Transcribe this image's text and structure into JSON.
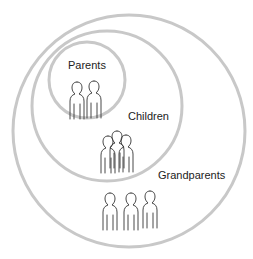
{
  "diagram": {
    "circles": [
      {
        "name": "grandparents",
        "label": "Grandparents",
        "people_count": 3
      },
      {
        "name": "children",
        "label": "Children",
        "people_count": 3
      },
      {
        "name": "parents",
        "label": "Parents",
        "people_count": 2
      }
    ],
    "ring_color": "#c8c8c8",
    "stroke_color": "#333333"
  }
}
